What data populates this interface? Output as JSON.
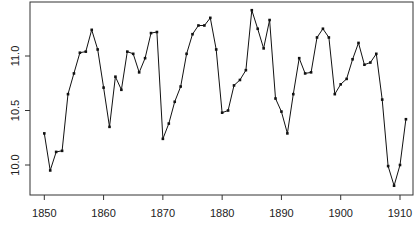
{
  "chart_data": {
    "type": "line",
    "title": "",
    "xlabel": "",
    "ylabel": "",
    "markers": true,
    "grid": false,
    "legend": null,
    "xlim": [
      1847.6,
      1912.2
    ],
    "ylim": [
      9.72,
      11.49
    ],
    "xticks": [
      1850,
      1860,
      1870,
      1880,
      1890,
      1900,
      1910
    ],
    "yticks": [
      10.0,
      10.5,
      11.0
    ],
    "ytick_labels": [
      "10.0",
      "10.5",
      "11.0"
    ],
    "x": [
      1850,
      1851,
      1852,
      1853,
      1854,
      1855,
      1856,
      1857,
      1858,
      1859,
      1860,
      1861,
      1862,
      1863,
      1864,
      1865,
      1866,
      1867,
      1868,
      1869,
      1870,
      1871,
      1872,
      1873,
      1874,
      1875,
      1876,
      1877,
      1878,
      1879,
      1880,
      1881,
      1882,
      1883,
      1884,
      1885,
      1886,
      1887,
      1888,
      1889,
      1890,
      1891,
      1892,
      1893,
      1894,
      1895,
      1896,
      1897,
      1898,
      1899,
      1900,
      1901,
      1902,
      1903,
      1904,
      1905,
      1906,
      1907,
      1908,
      1909,
      1910,
      1911
    ],
    "values": [
      10.29,
      9.95,
      10.12,
      10.13,
      10.65,
      10.84,
      11.03,
      11.04,
      11.24,
      11.06,
      10.71,
      10.35,
      10.81,
      10.69,
      11.04,
      11.02,
      10.85,
      10.98,
      11.21,
      11.22,
      10.24,
      10.38,
      10.58,
      10.72,
      11.02,
      11.2,
      11.28,
      11.28,
      11.35,
      11.06,
      10.48,
      10.5,
      10.73,
      10.78,
      10.87,
      11.42,
      11.25,
      11.07,
      11.33,
      10.61,
      10.49,
      10.29,
      10.65,
      10.98,
      10.84,
      10.85,
      11.17,
      11.25,
      11.17,
      10.65,
      10.74,
      10.79,
      10.97,
      11.12,
      10.92,
      10.94,
      11.02,
      10.6,
      9.99,
      9.81,
      10.0,
      10.42
    ]
  },
  "style": {
    "line_color": "#111111",
    "frame_color": "#333333"
  }
}
